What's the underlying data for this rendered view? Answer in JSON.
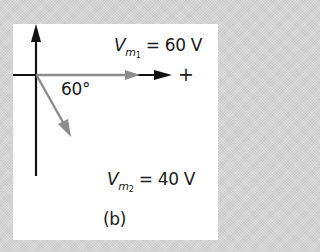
{
  "diagram": {
    "panel_label": "(b)",
    "angle_label": "60°",
    "axis_plus_label": "+",
    "phasors": [
      {
        "name": "V_m1",
        "symbol": "V",
        "subscript_var": "m",
        "subscript_index": "1",
        "equals": "=",
        "value": "60 V",
        "angle_deg": 0,
        "color": "#8c8c8c"
      },
      {
        "name": "V_m2",
        "symbol": "V",
        "subscript_var": "m",
        "subscript_index": "2",
        "equals": "=",
        "value": "40 V",
        "angle_deg": -60,
        "color": "#8c8c8c"
      }
    ],
    "colors": {
      "axis": "#111111",
      "phasor": "#8c8c8c",
      "panel_bg": "#ffffff",
      "page_bg": "#d4d4d4"
    }
  }
}
